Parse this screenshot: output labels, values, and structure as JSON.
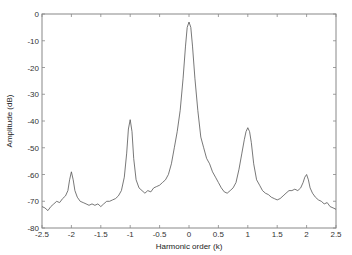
{
  "chart_data": {
    "type": "line",
    "title": "",
    "xlabel": "Harmonic order (k)",
    "ylabel": "Amplitude (dB)",
    "xlim": [
      -2.5,
      2.5
    ],
    "ylim": [
      -80,
      0
    ],
    "xticks": [
      -2.5,
      -2,
      -1.5,
      -1,
      -0.5,
      0,
      0.5,
      1,
      1.5,
      2,
      2.5
    ],
    "xtick_labels": [
      "-2.5",
      "-2",
      "-1.5",
      "-1",
      "-0.5",
      "0",
      "0.5",
      "1",
      "1.5",
      "2",
      "2.5"
    ],
    "yticks": [
      0,
      -10,
      -20,
      -30,
      -40,
      -50,
      -60,
      -70,
      -80
    ],
    "ytick_labels": [
      "0",
      "-10",
      "-20",
      "-30",
      "-40",
      "-50",
      "-60",
      "-70",
      "-80"
    ],
    "grid": false,
    "legend": null,
    "series": [
      {
        "name": "spectrum",
        "color": "#555555",
        "x": [
          -2.5,
          -2.45,
          -2.4,
          -2.35,
          -2.3,
          -2.25,
          -2.2,
          -2.15,
          -2.1,
          -2.06,
          -2.03,
          -2.0,
          -1.97,
          -1.94,
          -1.9,
          -1.85,
          -1.8,
          -1.75,
          -1.7,
          -1.65,
          -1.6,
          -1.55,
          -1.5,
          -1.45,
          -1.4,
          -1.35,
          -1.3,
          -1.25,
          -1.2,
          -1.15,
          -1.1,
          -1.06,
          -1.03,
          -1.0,
          -0.97,
          -0.94,
          -0.9,
          -0.85,
          -0.8,
          -0.75,
          -0.7,
          -0.65,
          -0.6,
          -0.55,
          -0.5,
          -0.45,
          -0.4,
          -0.35,
          -0.3,
          -0.25,
          -0.2,
          -0.15,
          -0.1,
          -0.06,
          -0.03,
          0.0,
          0.03,
          0.06,
          0.1,
          0.15,
          0.2,
          0.25,
          0.3,
          0.35,
          0.4,
          0.45,
          0.5,
          0.55,
          0.6,
          0.65,
          0.7,
          0.75,
          0.8,
          0.85,
          0.9,
          0.94,
          0.97,
          1.0,
          1.03,
          1.06,
          1.1,
          1.15,
          1.2,
          1.25,
          1.3,
          1.35,
          1.4,
          1.45,
          1.5,
          1.55,
          1.6,
          1.65,
          1.7,
          1.75,
          1.8,
          1.85,
          1.9,
          1.94,
          1.97,
          2.0,
          2.03,
          2.06,
          2.1,
          2.15,
          2.2,
          2.25,
          2.3,
          2.35,
          2.4,
          2.45,
          2.5
        ],
        "y": [
          -72,
          -72.5,
          -73.5,
          -72,
          -71,
          -70,
          -70.5,
          -69,
          -68,
          -66,
          -62,
          -59,
          -62,
          -66,
          -68.5,
          -70,
          -70.5,
          -71,
          -71.5,
          -71,
          -71.5,
          -71,
          -72,
          -71,
          -70,
          -70,
          -69.5,
          -69,
          -68,
          -66,
          -61,
          -52,
          -43,
          -39.5,
          -44,
          -54,
          -62,
          -65,
          -66,
          -67,
          -66,
          -66.5,
          -65,
          -64.5,
          -64,
          -63,
          -62,
          -60,
          -56,
          -50,
          -44,
          -36,
          -24,
          -12,
          -5,
          -3,
          -5,
          -12,
          -24,
          -36,
          -46,
          -50,
          -54,
          -56,
          -59,
          -61,
          -63,
          -65,
          -66.5,
          -67,
          -66,
          -65,
          -63,
          -58,
          -52,
          -47,
          -44,
          -42.5,
          -44,
          -48,
          -56,
          -62,
          -64,
          -66,
          -67,
          -67.5,
          -68.5,
          -69,
          -69.5,
          -69,
          -68,
          -67,
          -66,
          -66,
          -65.5,
          -66,
          -65,
          -63,
          -61,
          -60,
          -62,
          -65,
          -67,
          -68.5,
          -69.5,
          -70,
          -71,
          -70.5,
          -72,
          -72.5,
          -73
        ]
      }
    ]
  }
}
